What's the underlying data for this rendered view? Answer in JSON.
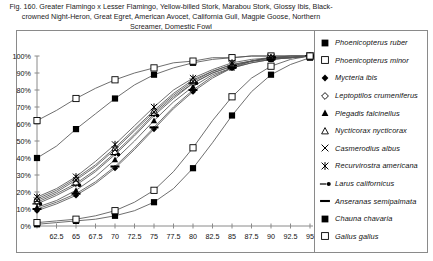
{
  "caption": "Fig. 160.  Greater Flamingo x Lesser Flamingo, Yellow-billed Stork, Marabou Stork, Glossy Ibis, Black-crowned Night-Heron, Great Egret, American Avocet, California Gull, Magpie Goose, Northern Screamer, Domestic Fowl",
  "chart_data": {
    "type": "line",
    "xlabel": "",
    "ylabel": "",
    "x": [
      60,
      62.5,
      65,
      67.5,
      70,
      72.5,
      75,
      77.5,
      80,
      82.5,
      85,
      87.5,
      90,
      92.5,
      95
    ],
    "xticklabels": [
      "",
      "62.5",
      "65",
      "67.5",
      "70",
      "72.5",
      "75",
      "77.5",
      "80",
      "82.5",
      "85",
      "87.5",
      "90",
      "92.5",
      "95"
    ],
    "xlim": [
      60,
      95
    ],
    "ylim": [
      0,
      100
    ],
    "yticklabels": [
      "0%",
      "10%",
      "20%",
      "30%",
      "40%",
      "50%",
      "60%",
      "70%",
      "80%",
      "90%",
      "100%"
    ],
    "ytickvalues": [
      0,
      10,
      20,
      30,
      40,
      50,
      60,
      70,
      80,
      90,
      100
    ],
    "grid": false,
    "legend_position": "right",
    "marker_interval": 2,
    "series": [
      {
        "name": "Phoenicopterus ruber",
        "marker": "filled-square",
        "values": [
          40,
          47,
          57,
          66,
          75,
          83,
          89,
          93,
          96,
          98,
          99,
          100,
          100,
          100,
          100
        ]
      },
      {
        "name": "Phoenicopterus minor",
        "marker": "open-square",
        "values": [
          62,
          68,
          75,
          81,
          86,
          90,
          93,
          96,
          97,
          99,
          99,
          100,
          100,
          100,
          100
        ]
      },
      {
        "name": "Mycteria ibis",
        "marker": "filled-diamond",
        "values": [
          9,
          13,
          18,
          25,
          34,
          45,
          57,
          69,
          79,
          87,
          93,
          96,
          98,
          99,
          100
        ]
      },
      {
        "name": "Leptoptilos crumeniferus",
        "marker": "open-diamond",
        "values": [
          14,
          19,
          25,
          33,
          43,
          54,
          66,
          76,
          84,
          90,
          94,
          97,
          99,
          99,
          100
        ]
      },
      {
        "name": "Plegadis falcinellus",
        "marker": "filled-triangle",
        "values": [
          11,
          15,
          21,
          29,
          39,
          50,
          62,
          73,
          82,
          89,
          93,
          97,
          98,
          99,
          100
        ]
      },
      {
        "name": "Nycticorax nycticorax",
        "marker": "open-triangle",
        "values": [
          16,
          21,
          28,
          36,
          46,
          57,
          68,
          78,
          86,
          91,
          95,
          97,
          99,
          100,
          100
        ]
      },
      {
        "name": "Casmerodius albus",
        "marker": "cross-x",
        "values": [
          15,
          20,
          27,
          35,
          45,
          56,
          67,
          77,
          85,
          91,
          95,
          97,
          99,
          99,
          100
        ]
      },
      {
        "name": "Recurvirostra americana",
        "marker": "star-x",
        "values": [
          17,
          22,
          29,
          38,
          48,
          59,
          70,
          80,
          87,
          92,
          96,
          98,
          99,
          100,
          100
        ]
      },
      {
        "name": "Larus  californicus",
        "marker": "dash-dot",
        "values": [
          13,
          18,
          24,
          32,
          42,
          53,
          65,
          75,
          84,
          90,
          94,
          97,
          99,
          99,
          100
        ]
      },
      {
        "name": "Anseranas semipalmata",
        "marker": "heavy-dash",
        "values": [
          10,
          14,
          19,
          26,
          35,
          46,
          58,
          70,
          80,
          88,
          93,
          96,
          98,
          99,
          100
        ]
      },
      {
        "name": "Chauna chavaria",
        "marker": "filled-square",
        "values": [
          1,
          2,
          3,
          4,
          6,
          9,
          14,
          22,
          34,
          49,
          65,
          79,
          89,
          95,
          99
        ]
      },
      {
        "name": "Gallus gallus",
        "marker": "open-square",
        "values": [
          2,
          3,
          4,
          6,
          9,
          14,
          21,
          32,
          46,
          62,
          76,
          87,
          94,
          98,
          100
        ]
      }
    ]
  },
  "legend": {
    "items": [
      {
        "label": "Phoenicopterus ruber",
        "marker": "filled-square"
      },
      {
        "label": "Phoenicopterus minor",
        "marker": "open-square"
      },
      {
        "label": "Mycteria ibis",
        "marker": "filled-diamond"
      },
      {
        "label": "Leptoptilos crumeniferus",
        "marker": "open-diamond"
      },
      {
        "label": "Plegadis falcinellus",
        "marker": "filled-triangle"
      },
      {
        "label": "Nycticorax nycticorax",
        "marker": "open-triangle"
      },
      {
        "label": "Casmerodius albus",
        "marker": "cross-x"
      },
      {
        "label": "Recurvirostra americana",
        "marker": "star-x"
      },
      {
        "label": "Larus  californicus",
        "marker": "dash-dot"
      },
      {
        "label": "Anseranas semipalmata",
        "marker": "heavy-dash"
      },
      {
        "label": "Chauna chavaria",
        "marker": "filled-square"
      },
      {
        "label": "Gallus gallus",
        "marker": "open-square"
      }
    ]
  },
  "colors": {
    "line": "#555555",
    "axis": "#8a8a8a",
    "marker": "#000000",
    "text": "#111111"
  }
}
